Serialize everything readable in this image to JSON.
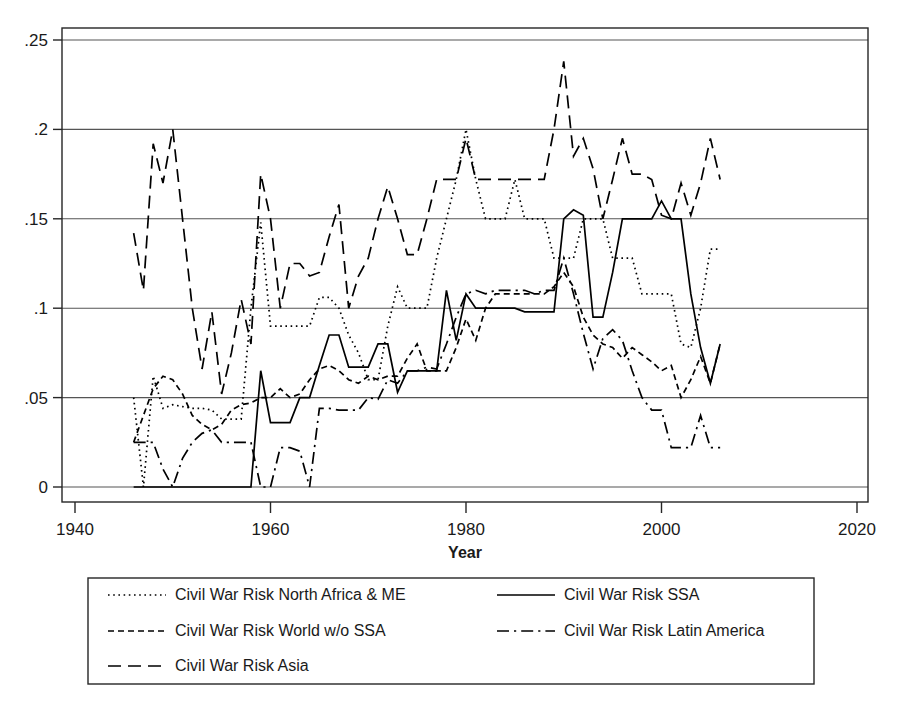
{
  "chart_data": {
    "type": "line",
    "title": "",
    "xlabel": "Year",
    "ylabel": "",
    "xlim": [
      1940,
      2020
    ],
    "ylim": [
      0,
      0.25
    ],
    "grid": true,
    "legend_position": "bottom",
    "xticks": [
      "1940",
      "1960",
      "1980",
      "2000",
      "2020"
    ],
    "xtick_values": [
      1940,
      1960,
      1980,
      2000,
      2020
    ],
    "yticks": [
      "0",
      ".05",
      ".1",
      ".15",
      ".2",
      ".25"
    ],
    "ytick_values": [
      0,
      0.05,
      0.1,
      0.15,
      0.2,
      0.25
    ],
    "x": [
      1946,
      1947,
      1948,
      1949,
      1950,
      1951,
      1952,
      1953,
      1954,
      1955,
      1956,
      1957,
      1958,
      1959,
      1960,
      1961,
      1962,
      1963,
      1964,
      1965,
      1966,
      1967,
      1968,
      1969,
      1970,
      1971,
      1972,
      1973,
      1974,
      1975,
      1976,
      1977,
      1978,
      1979,
      1980,
      1981,
      1982,
      1983,
      1984,
      1985,
      1986,
      1987,
      1988,
      1989,
      1990,
      1991,
      1992,
      1993,
      1994,
      1995,
      1996,
      1997,
      1998,
      1999,
      2000,
      2001,
      2002,
      2003,
      2004,
      2005,
      2006
    ],
    "series": [
      {
        "name": "Civil War Risk North Africa & ME",
        "dash": "dotted",
        "values": [
          0.05,
          0.0,
          0.062,
          0.044,
          0.046,
          0.045,
          0.044,
          0.044,
          0.043,
          0.038,
          0.038,
          0.038,
          0.1,
          0.148,
          0.09,
          0.09,
          0.09,
          0.09,
          0.09,
          0.106,
          0.106,
          0.1,
          0.085,
          0.075,
          0.06,
          0.06,
          0.09,
          0.112,
          0.1,
          0.1,
          0.1,
          0.128,
          0.15,
          0.172,
          0.2,
          0.172,
          0.15,
          0.15,
          0.15,
          0.172,
          0.15,
          0.15,
          0.15,
          0.128,
          0.128,
          0.128,
          0.15,
          0.15,
          0.15,
          0.128,
          0.128,
          0.128,
          0.108,
          0.108,
          0.108,
          0.108,
          0.08,
          0.078,
          0.1,
          0.133,
          0.133
        ]
      },
      {
        "name": "Civil War Risk World w/o SSA",
        "dash": "dashed",
        "values": [
          0.025,
          0.04,
          0.055,
          0.062,
          0.06,
          0.052,
          0.04,
          0.035,
          0.032,
          0.035,
          0.043,
          0.046,
          0.047,
          0.05,
          0.05,
          0.055,
          0.05,
          0.052,
          0.06,
          0.066,
          0.068,
          0.065,
          0.06,
          0.058,
          0.062,
          0.06,
          0.062,
          0.062,
          0.072,
          0.08,
          0.065,
          0.065,
          0.065,
          0.078,
          0.094,
          0.082,
          0.1,
          0.108,
          0.108,
          0.108,
          0.108,
          0.108,
          0.108,
          0.112,
          0.12,
          0.112,
          0.095,
          0.085,
          0.08,
          0.078,
          0.072,
          0.078,
          0.074,
          0.07,
          0.065,
          0.068,
          0.05,
          0.06,
          0.073,
          0.058,
          0.08
        ]
      },
      {
        "name": "Civil War Risk Asia",
        "dash": "longdash",
        "values": [
          0.142,
          0.11,
          0.192,
          0.17,
          0.2,
          0.15,
          0.1,
          0.066,
          0.098,
          0.052,
          0.075,
          0.105,
          0.08,
          0.175,
          0.15,
          0.1,
          0.125,
          0.125,
          0.118,
          0.12,
          0.14,
          0.158,
          0.1,
          0.118,
          0.128,
          0.15,
          0.168,
          0.15,
          0.13,
          0.13,
          0.15,
          0.172,
          0.172,
          0.172,
          0.195,
          0.172,
          0.172,
          0.172,
          0.172,
          0.172,
          0.172,
          0.172,
          0.172,
          0.2,
          0.238,
          0.185,
          0.195,
          0.178,
          0.15,
          0.172,
          0.195,
          0.175,
          0.175,
          0.172,
          0.152,
          0.15,
          0.17,
          0.152,
          0.17,
          0.195,
          0.172
        ]
      },
      {
        "name": "Civil War Risk SSA",
        "dash": "solid",
        "values": [
          0.0,
          0.0,
          0.0,
          0.0,
          0.0,
          0.0,
          0.0,
          0.0,
          0.0,
          0.0,
          0.0,
          0.0,
          0.0,
          0.065,
          0.036,
          0.036,
          0.036,
          0.05,
          0.05,
          0.068,
          0.085,
          0.085,
          0.067,
          0.067,
          0.067,
          0.08,
          0.08,
          0.053,
          0.065,
          0.065,
          0.065,
          0.065,
          0.11,
          0.082,
          0.108,
          0.1,
          0.1,
          0.1,
          0.1,
          0.1,
          0.098,
          0.098,
          0.098,
          0.098,
          0.15,
          0.155,
          0.152,
          0.095,
          0.095,
          0.12,
          0.15,
          0.15,
          0.15,
          0.15,
          0.16,
          0.15,
          0.15,
          0.108,
          0.078,
          0.058,
          0.08
        ]
      },
      {
        "name": "Civil War Risk Latin America",
        "dash": "dashdot",
        "values": [
          0.025,
          0.025,
          0.025,
          0.01,
          0.0,
          0.016,
          0.025,
          0.03,
          0.032,
          0.025,
          0.025,
          0.025,
          0.025,
          0.0,
          0.0,
          0.022,
          0.022,
          0.02,
          0.0,
          0.044,
          0.044,
          0.043,
          0.043,
          0.043,
          0.05,
          0.049,
          0.06,
          0.058,
          0.065,
          0.065,
          0.067,
          0.066,
          0.08,
          0.095,
          0.108,
          0.11,
          0.108,
          0.11,
          0.11,
          0.11,
          0.11,
          0.108,
          0.11,
          0.11,
          0.128,
          0.108,
          0.086,
          0.066,
          0.083,
          0.088,
          0.082,
          0.065,
          0.05,
          0.043,
          0.043,
          0.022,
          0.022,
          0.022,
          0.04,
          0.022,
          0.022
        ]
      }
    ]
  },
  "legend": {
    "entries": [
      {
        "label": "Civil War Risk North Africa & ME",
        "dash": "dotted"
      },
      {
        "label": "Civil War Risk SSA",
        "dash": "solid"
      },
      {
        "label": "Civil War Risk World w/o SSA",
        "dash": "dashed"
      },
      {
        "label": "Civil War Risk Latin America",
        "dash": "dashdot"
      },
      {
        "label": "Civil War Risk Asia",
        "dash": "longdash"
      }
    ]
  },
  "colors": {
    "line": "#000000",
    "grid": "#555555",
    "axis": "#262626",
    "background": "#ffffff"
  }
}
